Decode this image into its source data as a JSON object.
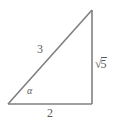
{
  "figure": {
    "type": "right-triangle-diagram",
    "background_color": "#ffffff",
    "stroke_color": "#808080",
    "text_color": "#5a5a5a",
    "vertices": {
      "bottom_left": [
        8,
        104
      ],
      "bottom_right": [
        92,
        104
      ],
      "top_right": [
        92,
        10
      ]
    },
    "labels": {
      "hypotenuse": "3",
      "vertical_side_sqrt_sign": "√",
      "vertical_side_radicand": "5",
      "vertical_side_full": "√5",
      "base": "2",
      "angle": "α"
    }
  }
}
